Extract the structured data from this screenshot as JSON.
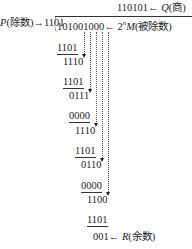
{
  "quotient": {
    "value": "110101",
    "arrow": "←",
    "label_var": "Q",
    "label_cn": "(商)"
  },
  "divisor": {
    "label_var": "P",
    "label_cn": "(除数)",
    "arrow": "→",
    "value": "1101"
  },
  "dividend": {
    "value": "101001000",
    "arrow": "←",
    "label_prefix": "2",
    "label_sup": "n",
    "label_var": "M",
    "label_cn": "(被除数)"
  },
  "steps": [
    {
      "value": "1101",
      "underline": true
    },
    {
      "value": "1110",
      "underline": false
    },
    {
      "value": "1101",
      "underline": true
    },
    {
      "value": "0111",
      "underline": false
    },
    {
      "value": "0000",
      "underline": true
    },
    {
      "value": "1110",
      "underline": false
    },
    {
      "value": "1101",
      "underline": true
    },
    {
      "value": "0110",
      "underline": false
    },
    {
      "value": "0000",
      "underline": true
    },
    {
      "value": "1100",
      "underline": false
    },
    {
      "value": "1101",
      "underline": true
    }
  ],
  "remainder": {
    "value": "001",
    "arrow": "←",
    "label_var": "R",
    "label_cn": "(余数)"
  }
}
